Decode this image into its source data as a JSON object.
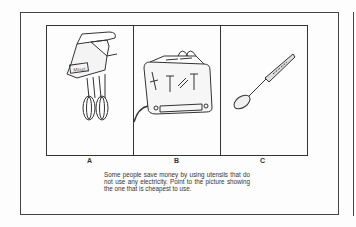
{
  "document": {
    "type": "test item",
    "panels": [
      {
        "label": "A",
        "picture": "electric hand mixer"
      },
      {
        "label": "B",
        "picture": "electric toaster"
      },
      {
        "label": "C",
        "picture": "spoon"
      }
    ],
    "question": "Some people save money by using utensils that do not use any electricity. Point to the picture showing the one that is cheapest to use."
  }
}
